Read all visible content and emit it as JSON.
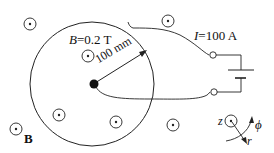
{
  "diagram": {
    "field_label": {
      "symbol": "B",
      "text": "=0.2 T"
    },
    "current_label": {
      "symbol": "I",
      "text": "=100 A"
    },
    "radius_label": "100 mm",
    "field_vector_label": "B",
    "axes": {
      "z": "z",
      "phi": "ϕ",
      "r": "r"
    },
    "colors": {
      "line": "#222222",
      "background": "#ffffff"
    },
    "disk": {
      "cx": 92,
      "cy": 84,
      "r": 62
    },
    "center_contact": {
      "cx": 94,
      "cy": 84,
      "r": 4.5
    },
    "field_out_of_page_markers": [
      {
        "cx": 30,
        "cy": 24
      },
      {
        "cx": 168,
        "cy": 21
      },
      {
        "cx": 88,
        "cy": 56
      },
      {
        "cx": 59,
        "cy": 115
      },
      {
        "cx": 116,
        "cy": 122
      },
      {
        "cx": 173,
        "cy": 125
      },
      {
        "cx": 16,
        "cy": 129
      }
    ],
    "terminals": [
      {
        "cx": 213,
        "cy": 55
      },
      {
        "cx": 214,
        "cy": 92
      }
    ]
  }
}
